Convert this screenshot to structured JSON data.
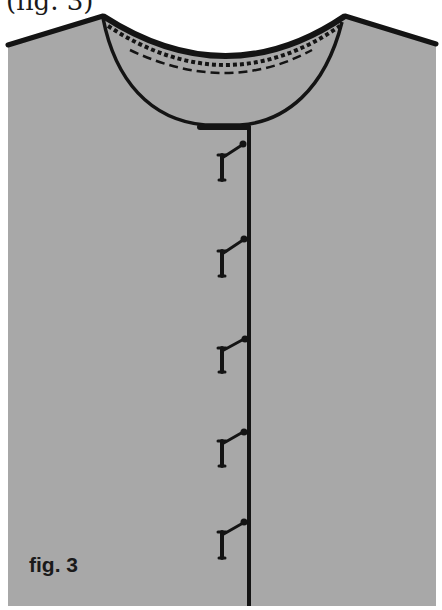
{
  "caption_top": "(fig. 3)",
  "figure_label": "fig. 3",
  "colors": {
    "background": "#ffffff",
    "fabric": "#a8a8a8",
    "ink": "#141414"
  },
  "diagram": {
    "parts": [
      "left-shoulder",
      "right-shoulder",
      "neckline",
      "neckline-facing",
      "stitch-line",
      "center-front-edge",
      "pins"
    ],
    "pin_count": 5
  }
}
